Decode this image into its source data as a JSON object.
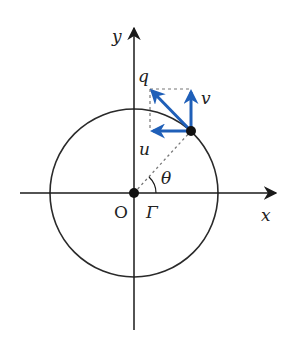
{
  "diagram": {
    "colors": {
      "axis": "#1a1a1a",
      "circle": "#2a2a2a",
      "vector": "#1f5fb8",
      "dashed": "#777777",
      "point": "#111111"
    },
    "labels": {
      "x_axis": "x",
      "y_axis": "y",
      "origin": "O",
      "curve": "Γ",
      "angle": "θ",
      "vector_q": "q",
      "vector_v": "v",
      "vector_u": "u"
    },
    "geometry": {
      "origin": [
        134,
        193
      ],
      "radius": 84,
      "point": [
        191,
        131
      ],
      "vector_v_tip": [
        191,
        89
      ],
      "vector_u_tip": [
        150,
        131
      ],
      "vector_q_tip": [
        150,
        89
      ]
    }
  }
}
